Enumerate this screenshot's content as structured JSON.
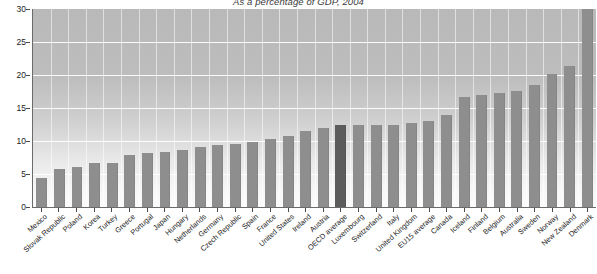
{
  "chart_data": {
    "type": "bar",
    "title": "As a percentage of GDP, 2004",
    "xlabel": "",
    "ylabel": "",
    "ylim": [
      0,
      30
    ],
    "yticks": [
      0,
      5,
      10,
      15,
      20,
      25,
      30
    ],
    "grid": true,
    "legend": "none",
    "highlight_category": "OECD average",
    "highlight_color": "#5c5c5c",
    "bar_color": "#8e8e8e",
    "categories": [
      "Mexico",
      "Slovak Republic",
      "Poland",
      "Korea",
      "Turkey",
      "Greece",
      "Portugal",
      "Japan",
      "Hungary",
      "Netherlands",
      "Germany",
      "Czech Republic",
      "Spain",
      "France",
      "United States",
      "Ireland",
      "Austria",
      "OECD average",
      "Luxembourg",
      "Switzerland",
      "Italy",
      "United Kingdom",
      "EU15 average",
      "Canada",
      "Iceland",
      "Finland",
      "Belgium",
      "Australia",
      "Sweden",
      "Norway",
      "New Zealand",
      "Denmark"
    ],
    "values": [
      4.4,
      5.8,
      6.1,
      6.6,
      6.6,
      7.9,
      8.2,
      8.4,
      8.6,
      9.1,
      9.4,
      9.6,
      9.9,
      10.3,
      10.8,
      11.5,
      11.9,
      12.4,
      12.4,
      12.5,
      12.5,
      12.7,
      13.1,
      14.0,
      16.7,
      17.0,
      17.2,
      17.6,
      18.5,
      20.1,
      21.4,
      30.0
    ]
  }
}
